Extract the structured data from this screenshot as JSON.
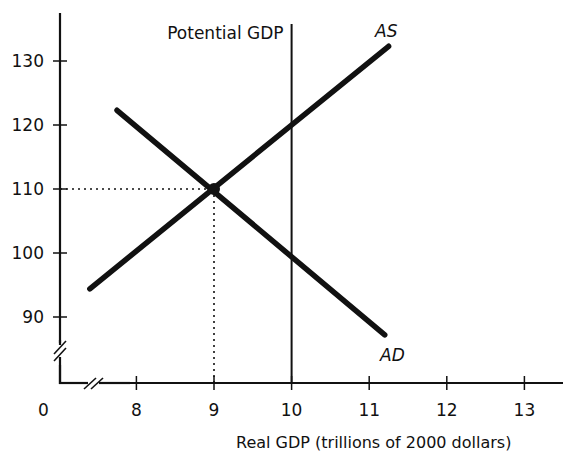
{
  "chart_data": {
    "type": "line",
    "title": "",
    "xlabel": "Real GDP (trillions of 2000 dollars)",
    "ylabel": "",
    "xlim": [
      7,
      13.5
    ],
    "ylim": [
      85,
      135
    ],
    "origin_label": "0",
    "axis_breaks": {
      "x": true,
      "y": true
    },
    "grid": false,
    "legend": null,
    "x_ticks": [
      8,
      9,
      10,
      11,
      12,
      13
    ],
    "x_tick_labels": [
      "8",
      "9",
      "10",
      "11",
      "12",
      "13"
    ],
    "y_ticks": [
      90,
      100,
      110,
      120,
      130
    ],
    "y_tick_labels": [
      "90",
      "100",
      "110",
      "120",
      "130"
    ],
    "series": [
      {
        "name": "AS",
        "label": "AS",
        "points": [
          [
            7.4,
            94.4
          ],
          [
            11.25,
            132.3
          ]
        ]
      },
      {
        "name": "AD",
        "label": "AD",
        "points": [
          [
            7.75,
            122.3
          ],
          [
            11.2,
            87.2
          ]
        ]
      }
    ],
    "vertical_lines": [
      {
        "name": "Potential GDP",
        "label": "Potential GDP",
        "x": 10
      }
    ],
    "equilibrium": {
      "x": 9,
      "y": 110,
      "guides": "dotted"
    }
  }
}
